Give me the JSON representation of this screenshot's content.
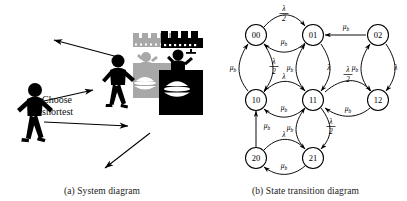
{
  "figure": {
    "panels": [
      {
        "id": "system-diagram",
        "caption": "(a) System diagram",
        "annotation": {
          "line1": "Choose",
          "line2": "shortest"
        },
        "actors": [
          {
            "name": "arriving-customer",
            "kind": "pedestrian"
          },
          {
            "name": "queued-customer",
            "kind": "pedestrian"
          }
        ],
        "servers": [
          {
            "name": "server-station-gray",
            "color": "#a8a8a8"
          },
          {
            "name": "server-station-black",
            "color": "#000000"
          }
        ],
        "flow_arrows": [
          {
            "name": "departure-arrow-upper-left",
            "direction": "up-left"
          },
          {
            "name": "join-queue-arrow-upper",
            "direction": "right"
          },
          {
            "name": "join-queue-arrow-lower",
            "direction": "right"
          },
          {
            "name": "departure-arrow-lower-left",
            "direction": "down-left"
          }
        ]
      },
      {
        "id": "state-transition-diagram",
        "caption": "(b) State transition diagram",
        "states": [
          {
            "id": "s00",
            "label": "00",
            "cx": 52,
            "cy": 35
          },
          {
            "id": "s01",
            "label": "01",
            "cx": 109,
            "cy": 35
          },
          {
            "id": "s02",
            "label": "02",
            "cx": 174,
            "cy": 35
          },
          {
            "id": "s10",
            "label": "10",
            "cx": 52,
            "cy": 100
          },
          {
            "id": "s11",
            "label": "11",
            "cx": 109,
            "cy": 100
          },
          {
            "id": "s12",
            "label": "12",
            "cx": 174,
            "cy": 100
          },
          {
            "id": "s20",
            "label": "20",
            "cx": 52,
            "cy": 158
          },
          {
            "id": "s21",
            "label": "21",
            "cx": 109,
            "cy": 158
          }
        ],
        "transitions": [
          {
            "name": "t-00-01",
            "from": "00",
            "to": "01",
            "rate": "lambda-over-2",
            "rate_text": "λ/2"
          },
          {
            "name": "t-01-00",
            "from": "01",
            "to": "00",
            "rate": "mu-b",
            "rate_text": "μb"
          },
          {
            "name": "t-02-01",
            "from": "02",
            "to": "01",
            "rate": "mu-b",
            "rate_text": "μb"
          },
          {
            "name": "t-00-10",
            "from": "00",
            "to": "10",
            "rate": "lambda-over-2",
            "rate_text": "λ/2"
          },
          {
            "name": "t-10-00",
            "from": "10",
            "to": "00",
            "rate": "mu-b",
            "rate_text": "μb"
          },
          {
            "name": "t-01-11",
            "from": "01",
            "to": "11",
            "rate": "lambda",
            "rate_text": "λ"
          },
          {
            "name": "t-11-01",
            "from": "11",
            "to": "01",
            "rate": "mu-b",
            "rate_text": "μb"
          },
          {
            "name": "t-02-12",
            "from": "02",
            "to": "12",
            "rate": "lambda",
            "rate_text": "λ"
          },
          {
            "name": "t-12-02",
            "from": "12",
            "to": "02",
            "rate": "mu-b",
            "rate_text": "μb"
          },
          {
            "name": "t-10-11",
            "from": "10",
            "to": "11",
            "rate": "lambda",
            "rate_text": "λ"
          },
          {
            "name": "t-11-10",
            "from": "11",
            "to": "10",
            "rate": "mu-b",
            "rate_text": "μb"
          },
          {
            "name": "t-11-12",
            "from": "11",
            "to": "12",
            "rate": "lambda-over-2",
            "rate_text": "λ/2"
          },
          {
            "name": "t-12-11",
            "from": "12",
            "to": "11",
            "rate": "mu-b",
            "rate_text": "μb"
          },
          {
            "name": "t-11-21",
            "from": "11",
            "to": "21",
            "rate": "lambda-over-2",
            "rate_text": "λ/2"
          },
          {
            "name": "t-21-11",
            "from": "21",
            "to": "11",
            "rate": "mu-b",
            "rate_text": "μb"
          },
          {
            "name": "t-20-10",
            "from": "20",
            "to": "10",
            "rate": "mu-b",
            "rate_text": "μb"
          },
          {
            "name": "t-20-21",
            "from": "20",
            "to": "21",
            "rate": "lambda",
            "rate_text": "λ"
          },
          {
            "name": "t-21-20",
            "from": "21",
            "to": "20",
            "rate": "mu-b",
            "rate_text": "μb"
          }
        ],
        "symbols": {
          "lambda": "λ",
          "mu": "μ",
          "sub_b": "b",
          "half_numer": "λ",
          "half_denom": "2"
        }
      }
    ]
  }
}
